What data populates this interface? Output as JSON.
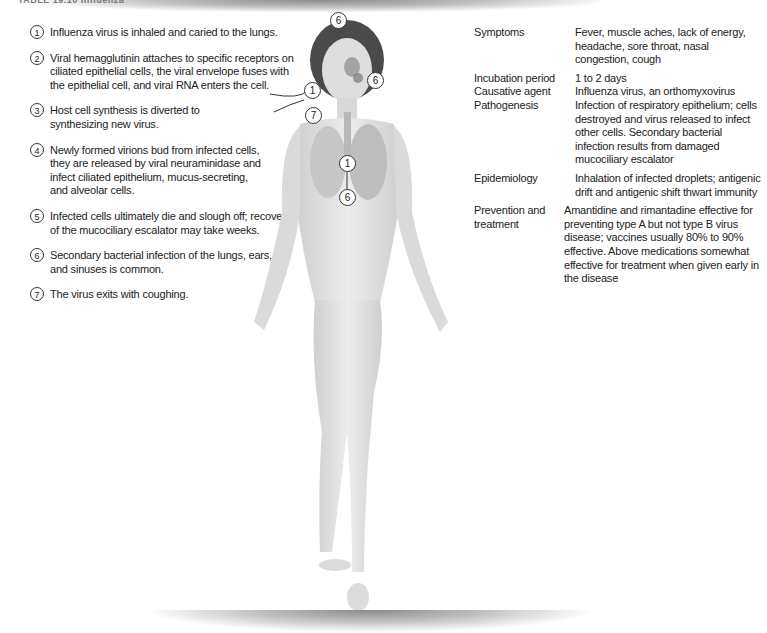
{
  "header": {
    "title": "TABLE 19.10 Influenza"
  },
  "steps": [
    {
      "num": "1",
      "text": "Influenza virus is inhaled and caried to the lungs."
    },
    {
      "num": "2",
      "text": "Viral hemagglutinin attaches to specific receptors on ciliated epithelial cells, the viral envelope fuses with the epithelial cell, and viral RNA enters the cell."
    },
    {
      "num": "3",
      "text": "Host cell synthesis is diverted to synthesizing new virus."
    },
    {
      "num": "4",
      "text": "Newly formed virions bud from infected cells, they are released by viral neuraminidase and infect ciliated epithelium, mucus-secreting, and alveolar cells."
    },
    {
      "num": "5",
      "text": "Infected cells ultimately die and slough off; recovery of the mucociliary escalator may take weeks."
    },
    {
      "num": "6",
      "text": "Secondary bacterial infection of the lungs, ears, and sinuses is common."
    },
    {
      "num": "7",
      "text": "The virus exits with coughing."
    }
  ],
  "table": [
    {
      "key": "Symptoms",
      "value": "Fever, muscle aches, lack of energy, headache, sore throat, nasal congestion, cough"
    },
    {
      "key": "Incubation period",
      "value": "1 to 2 days"
    },
    {
      "key": "Causative agent",
      "value": "Influenza virus, an orthomyxovirus"
    },
    {
      "key": "Pathogenesis",
      "value": "Infection of respiratory epithelium; cells destroyed and virus released to infect other cells. Secondary bacterial infection results from damaged mucociliary escalator"
    },
    {
      "key": "Epidemiology",
      "value": "Inhalation of infected droplets; antigenic drift and antigenic shift thwart immunity"
    },
    {
      "key": "Prevention and treatment",
      "value": "Amantidine and rimantadine effective for preventing type A but not type B virus disease; vaccines usually 80% to 90% effective. Above medications somewhat effective for treatment when given early in the disease"
    }
  ],
  "figure": {
    "callouts": {
      "head": "6",
      "ear": "6",
      "nose_in": "1",
      "mouth_out": "7",
      "lung_in": "1",
      "lung_out": "6"
    }
  }
}
